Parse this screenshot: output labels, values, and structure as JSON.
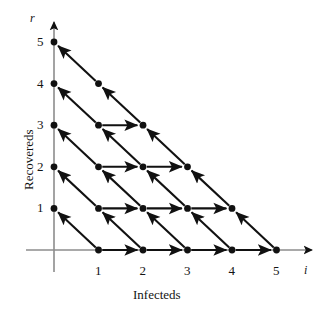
{
  "figure": {
    "background": "#ffffff",
    "ink": "#111111",
    "axis_color": "#8c8c8c"
  },
  "axes": {
    "x": {
      "name": "i",
      "title": "Infecteds",
      "ticks": [
        "1",
        "2",
        "3",
        "4",
        "5"
      ]
    },
    "y": {
      "name": "r",
      "title": "Recovereds",
      "ticks": [
        "5",
        "4",
        "3",
        "2",
        "1"
      ]
    }
  },
  "chart_data": {
    "type": "scatter",
    "title": "",
    "xlabel": "Infecteds",
    "ylabel": "Recovereds",
    "xlim": [
      0,
      5.9
    ],
    "ylim": [
      0,
      5.6
    ],
    "grid": false,
    "legend": null,
    "x_ticks": [
      1,
      2,
      3,
      4,
      5
    ],
    "y_ticks": [
      1,
      2,
      3,
      4,
      5
    ],
    "axis_arrowheads": true,
    "points": [
      {
        "i": 1,
        "r": 0
      },
      {
        "i": 2,
        "r": 0
      },
      {
        "i": 3,
        "r": 0
      },
      {
        "i": 4,
        "r": 0
      },
      {
        "i": 5,
        "r": 0
      },
      {
        "i": 0,
        "r": 1
      },
      {
        "i": 1,
        "r": 1
      },
      {
        "i": 2,
        "r": 1
      },
      {
        "i": 3,
        "r": 1
      },
      {
        "i": 4,
        "r": 1
      },
      {
        "i": 0,
        "r": 2
      },
      {
        "i": 1,
        "r": 2
      },
      {
        "i": 2,
        "r": 2
      },
      {
        "i": 3,
        "r": 2
      },
      {
        "i": 0,
        "r": 3
      },
      {
        "i": 1,
        "r": 3
      },
      {
        "i": 2,
        "r": 3
      },
      {
        "i": 0,
        "r": 4
      },
      {
        "i": 1,
        "r": 4
      },
      {
        "i": 0,
        "r": 5
      }
    ],
    "horizontal_arrows": [
      {
        "from": [
          1,
          0
        ],
        "to": [
          2,
          0
        ]
      },
      {
        "from": [
          2,
          0
        ],
        "to": [
          3,
          0
        ]
      },
      {
        "from": [
          3,
          0
        ],
        "to": [
          4,
          0
        ]
      },
      {
        "from": [
          4,
          0
        ],
        "to": [
          5,
          0
        ]
      },
      {
        "from": [
          1,
          1
        ],
        "to": [
          2,
          1
        ]
      },
      {
        "from": [
          2,
          1
        ],
        "to": [
          3,
          1
        ]
      },
      {
        "from": [
          3,
          1
        ],
        "to": [
          4,
          1
        ]
      },
      {
        "from": [
          1,
          2
        ],
        "to": [
          2,
          2
        ]
      },
      {
        "from": [
          2,
          2
        ],
        "to": [
          3,
          2
        ]
      },
      {
        "from": [
          1,
          3
        ],
        "to": [
          2,
          3
        ]
      }
    ],
    "diagonal_arrows": [
      {
        "from": [
          1,
          0
        ],
        "to": [
          0,
          1
        ]
      },
      {
        "from": [
          2,
          0
        ],
        "to": [
          1,
          1
        ]
      },
      {
        "from": [
          3,
          0
        ],
        "to": [
          2,
          1
        ]
      },
      {
        "from": [
          4,
          0
        ],
        "to": [
          3,
          1
        ]
      },
      {
        "from": [
          5,
          0
        ],
        "to": [
          4,
          1
        ]
      },
      {
        "from": [
          1,
          1
        ],
        "to": [
          0,
          2
        ]
      },
      {
        "from": [
          2,
          1
        ],
        "to": [
          1,
          2
        ]
      },
      {
        "from": [
          3,
          1
        ],
        "to": [
          2,
          2
        ]
      },
      {
        "from": [
          4,
          1
        ],
        "to": [
          3,
          2
        ]
      },
      {
        "from": [
          1,
          2
        ],
        "to": [
          0,
          3
        ]
      },
      {
        "from": [
          2,
          2
        ],
        "to": [
          1,
          3
        ]
      },
      {
        "from": [
          3,
          2
        ],
        "to": [
          2,
          3
        ]
      },
      {
        "from": [
          1,
          3
        ],
        "to": [
          0,
          4
        ]
      },
      {
        "from": [
          2,
          3
        ],
        "to": [
          1,
          4
        ]
      },
      {
        "from": [
          1,
          4
        ],
        "to": [
          0,
          5
        ]
      }
    ]
  }
}
